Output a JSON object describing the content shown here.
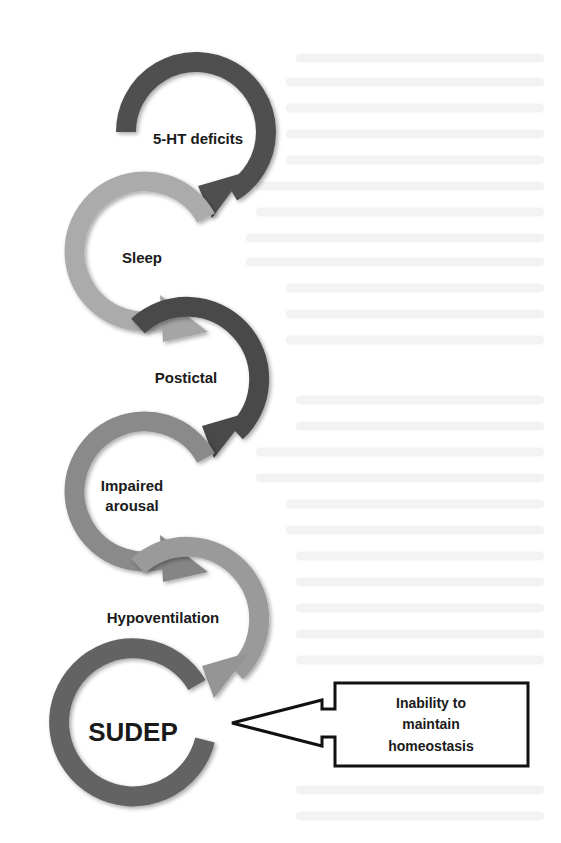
{
  "diagram": {
    "type": "flow-cycle",
    "steps": [
      {
        "id": "s1",
        "label": "5-HT deficits",
        "lines": [
          "5-HT deficits"
        ],
        "color": "#505050"
      },
      {
        "id": "s2",
        "label": "Sleep",
        "lines": [
          "Sleep"
        ],
        "color": "#ababab"
      },
      {
        "id": "s3",
        "label": "Postictal",
        "lines": [
          "Postictal"
        ],
        "color": "#4a4a4a"
      },
      {
        "id": "s4",
        "label": "Impaired arousal",
        "lines": [
          "Impaired",
          "arousal"
        ],
        "color": "#8a8a8a"
      },
      {
        "id": "s5",
        "label": "Hypoventilation",
        "lines": [
          "Hypoventilation"
        ],
        "color": "#9a9a9a"
      },
      {
        "id": "s6",
        "label": "SUDEP",
        "lines": [
          "SUDEP"
        ],
        "color": "#636363"
      }
    ],
    "callout": {
      "lines": [
        "Inability to",
        "maintain",
        "homeostasis"
      ],
      "points_to": "SUDEP"
    },
    "edges": [
      {
        "from": "5-HT deficits",
        "to": "Sleep"
      },
      {
        "from": "Sleep",
        "to": "Postictal"
      },
      {
        "from": "Postictal",
        "to": "Impaired arousal"
      },
      {
        "from": "Impaired arousal",
        "to": "Hypoventilation"
      },
      {
        "from": "Hypoventilation",
        "to": "SUDEP"
      },
      {
        "from": "Inability to maintain homeostasis",
        "to": "SUDEP"
      }
    ]
  }
}
